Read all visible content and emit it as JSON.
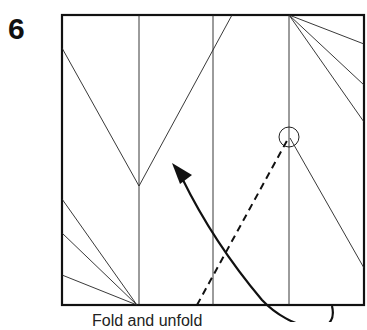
{
  "step": {
    "number": "6"
  },
  "caption": {
    "text": "Fold and unfold"
  },
  "diagram": {
    "type": "origami-crease-pattern",
    "colors": {
      "line": "#111111",
      "background": "#ffffff"
    },
    "square": {
      "x": 62,
      "y": 15,
      "width": 302,
      "height": 290
    },
    "vertical_creases_x": [
      139,
      213,
      289
    ],
    "top_v": {
      "left": [
        62,
        48
      ],
      "bottom": [
        139,
        186
      ],
      "right": [
        232,
        15
      ]
    },
    "top_right_fan": {
      "origin": [
        289,
        15
      ],
      "ends": [
        [
          364,
          44
        ],
        [
          364,
          85
        ],
        [
          364,
          122
        ]
      ]
    },
    "right_diagonal": {
      "from": [
        290,
        138
      ],
      "to": [
        364,
        268
      ]
    },
    "reference_point_circle": {
      "cx": 289,
      "cy": 137,
      "r": 10
    },
    "bottom_left_fan": {
      "origin": [
        137,
        305
      ],
      "ends": [
        [
          62,
          199
        ],
        [
          62,
          233
        ],
        [
          62,
          275
        ]
      ]
    },
    "valley_fold_dashed": {
      "from": [
        197,
        305
      ],
      "to": [
        289,
        137
      ]
    },
    "fold_arrow": {
      "start": [
        332,
        306
      ],
      "end": [
        176,
        166
      ],
      "direction": "up-left"
    }
  }
}
